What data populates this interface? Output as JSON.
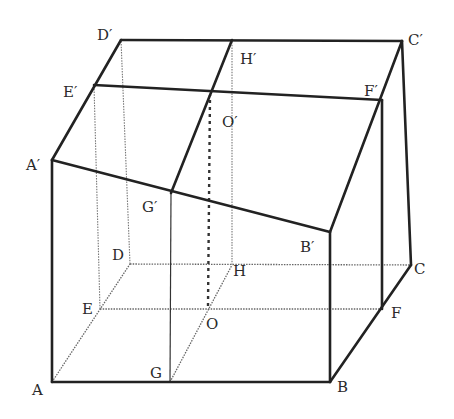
{
  "figure": {
    "type": "geometric-solid",
    "points": {
      "A": {
        "label": "A",
        "x": 52,
        "y": 382
      },
      "G": {
        "label": "G",
        "x": 170,
        "y": 382
      },
      "B": {
        "label": "B",
        "x": 330,
        "y": 382
      },
      "E": {
        "label": "E",
        "x": 100,
        "y": 309
      },
      "O": {
        "label": "O",
        "x": 208,
        "y": 308
      },
      "F": {
        "label": "F",
        "x": 382,
        "y": 309
      },
      "D": {
        "label": "D",
        "x": 130,
        "y": 264
      },
      "H": {
        "label": "H",
        "x": 232,
        "y": 265
      },
      "C": {
        "label": "C",
        "x": 411,
        "y": 265
      },
      "A1": {
        "label": "A′",
        "x": 52,
        "y": 160
      },
      "G1": {
        "label": "G′",
        "x": 171,
        "y": 193
      },
      "B1": {
        "label": "B′",
        "x": 330,
        "y": 232
      },
      "E1": {
        "label": "E′",
        "x": 94,
        "y": 85
      },
      "O1": {
        "label": "O′",
        "x": 210,
        "y": 93
      },
      "F1": {
        "label": "F′",
        "x": 382,
        "y": 100
      },
      "D1": {
        "label": "D′",
        "x": 121,
        "y": 40
      },
      "H1": {
        "label": "H′",
        "x": 232,
        "y": 40
      },
      "C1": {
        "label": "C′",
        "x": 402,
        "y": 41
      }
    },
    "labels": {
      "A": "A",
      "G": "G",
      "B": "B",
      "E": "E",
      "O": "O",
      "F": "F",
      "D": "D",
      "H": "H",
      "C": "C",
      "A1": "A′",
      "G1": "G′",
      "B1": "B′",
      "E1": "E′",
      "O1": "O′",
      "F1": "F′",
      "D1": "D′",
      "H1": "H′",
      "C1": "C′"
    }
  }
}
